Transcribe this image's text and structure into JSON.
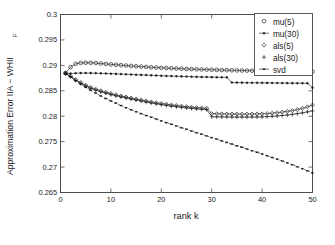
{
  "chart_data": {
    "type": "line",
    "title": "",
    "xlabel": "rank k",
    "ylabel": "Approximation Error IIA − WHII",
    "ylabel_subscript": "F",
    "xlim": [
      0,
      50
    ],
    "ylim": [
      0.265,
      0.3
    ],
    "grid": false,
    "legend_position": "top-right",
    "xticks": [
      0,
      10,
      20,
      30,
      40,
      50
    ],
    "xtick_labels": [
      "0",
      "10",
      "20",
      "30",
      "40",
      "50"
    ],
    "yticks": [
      0.265,
      0.27,
      0.275,
      0.28,
      0.285,
      0.29,
      0.295,
      0.3
    ],
    "ytick_labels": [
      "0.265",
      "0.27",
      "0.275",
      "0.28",
      "0.285",
      "0.29",
      "0.295",
      "0.3"
    ],
    "x": [
      1,
      2,
      3,
      4,
      5,
      6,
      7,
      8,
      9,
      10,
      11,
      12,
      13,
      14,
      15,
      16,
      17,
      18,
      19,
      20,
      21,
      22,
      23,
      24,
      25,
      26,
      27,
      28,
      29,
      30,
      31,
      32,
      33,
      34,
      35,
      36,
      37,
      38,
      39,
      40,
      41,
      42,
      43,
      44,
      45,
      46,
      47,
      48,
      49,
      50
    ],
    "series": [
      {
        "name": "mu(5)",
        "marker": "circle",
        "linestyle": "solid",
        "color": "#1a1a1a",
        "values": [
          0.2885,
          0.28965,
          0.2903,
          0.29048,
          0.29052,
          0.2905,
          0.29044,
          0.29036,
          0.29028,
          0.2902,
          0.29012,
          0.29004,
          0.28996,
          0.28989,
          0.28982,
          0.28975,
          0.28969,
          0.28963,
          0.28957,
          0.28952,
          0.28947,
          0.28942,
          0.28938,
          0.28934,
          0.2893,
          0.28926,
          0.28923,
          0.2892,
          0.28917,
          0.28914,
          0.28911,
          0.28908,
          0.28906,
          0.28903,
          0.28901,
          0.28899,
          0.28897,
          0.28895,
          0.28893,
          0.28891,
          0.28889,
          0.28888,
          0.28886,
          0.28885,
          0.28883,
          0.28882,
          0.28881,
          0.2888,
          0.28879,
          0.28878
        ]
      },
      {
        "name": "mu(30)",
        "marker": "dot",
        "linestyle": "solid",
        "color": "#1a1a1a",
        "values": [
          0.28845,
          0.2884,
          0.28845,
          0.28848,
          0.28849,
          0.28848,
          0.28846,
          0.28843,
          0.2884,
          0.28836,
          0.28832,
          0.28828,
          0.28824,
          0.2882,
          0.28816,
          0.28812,
          0.28808,
          0.28804,
          0.288,
          0.28796,
          0.28792,
          0.28789,
          0.28786,
          0.28783,
          0.2878,
          0.28777,
          0.28774,
          0.28772,
          0.2877,
          0.28768,
          0.28766,
          0.28764,
          0.28763,
          0.28662,
          0.28661,
          0.2866,
          0.28659,
          0.28658,
          0.28657,
          0.28656,
          0.28655,
          0.28654,
          0.28653,
          0.28652,
          0.28651,
          0.2865,
          0.28649,
          0.28648,
          0.28647,
          0.2856
        ]
      },
      {
        "name": "als(5)",
        "marker": "diamond",
        "linestyle": "solid",
        "color": "#1a1a1a",
        "values": [
          0.2884,
          0.2879,
          0.2872,
          0.2866,
          0.2861,
          0.28565,
          0.2853,
          0.285,
          0.2847,
          0.28445,
          0.2842,
          0.28398,
          0.28378,
          0.28358,
          0.28338,
          0.2832,
          0.283,
          0.28282,
          0.28265,
          0.2825,
          0.28236,
          0.28222,
          0.2821,
          0.28198,
          0.28188,
          0.28178,
          0.2817,
          0.28162,
          0.28156,
          0.2805,
          0.28048,
          0.28046,
          0.28044,
          0.28043,
          0.28042,
          0.28042,
          0.28042,
          0.28043,
          0.28044,
          0.28046,
          0.28052,
          0.2806,
          0.2807,
          0.28082,
          0.28095,
          0.2811,
          0.2813,
          0.28155,
          0.28185,
          0.2822
        ]
      },
      {
        "name": "als(30)",
        "marker": "plus",
        "linestyle": "solid",
        "color": "#1a1a1a",
        "values": [
          0.28838,
          0.2878,
          0.28705,
          0.28645,
          0.28592,
          0.28548,
          0.28512,
          0.2848,
          0.28452,
          0.28425,
          0.284,
          0.28378,
          0.28357,
          0.28337,
          0.28317,
          0.28298,
          0.28278,
          0.2826,
          0.28243,
          0.28227,
          0.28212,
          0.28198,
          0.28186,
          0.28174,
          0.28163,
          0.28153,
          0.28144,
          0.28136,
          0.28129,
          0.2799,
          0.27988,
          0.27986,
          0.27985,
          0.27984,
          0.27983,
          0.27983,
          0.27983,
          0.27984,
          0.27985,
          0.27986,
          0.27992,
          0.27998,
          0.28005,
          0.28014,
          0.28024,
          0.28036,
          0.2805,
          0.28066,
          0.28085,
          0.28105
        ]
      },
      {
        "name": "svd",
        "marker": "dash",
        "linestyle": "dashed",
        "color": "#1a1a1a",
        "values": [
          0.2884,
          0.2877,
          0.287,
          0.28632,
          0.28568,
          0.28508,
          0.28452,
          0.28398,
          0.28348,
          0.283,
          0.28254,
          0.2821,
          0.28168,
          0.28128,
          0.28089,
          0.28051,
          0.28014,
          0.27978,
          0.27943,
          0.27908,
          0.27874,
          0.2784,
          0.27807,
          0.27774,
          0.27741,
          0.27708,
          0.27676,
          0.27644,
          0.27612,
          0.2758,
          0.27548,
          0.27516,
          0.27484,
          0.27452,
          0.2742,
          0.27388,
          0.27355,
          0.27322,
          0.27289,
          0.27256,
          0.27222,
          0.27188,
          0.27153,
          0.27118,
          0.27082,
          0.27045,
          0.27007,
          0.26968,
          0.26928,
          0.26885
        ]
      }
    ]
  },
  "legend": {
    "entries": [
      {
        "label": "mu(5)",
        "marker": "circle"
      },
      {
        "label": "mu(30)",
        "marker": "dot"
      },
      {
        "label": "als(5)",
        "marker": "diamond"
      },
      {
        "label": "als(30)",
        "marker": "plus"
      },
      {
        "label": "svd",
        "marker": "dash"
      }
    ]
  }
}
